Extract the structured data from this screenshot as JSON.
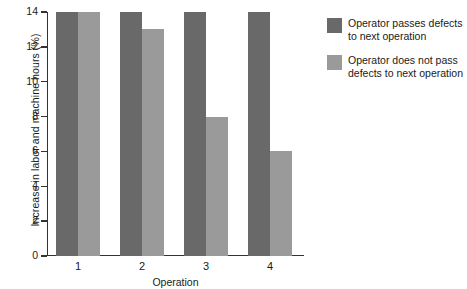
{
  "chart_data": {
    "type": "bar",
    "title": "",
    "xlabel": "Operation",
    "ylabel": "Increase in labor and machine hours (%)",
    "categories": [
      "1",
      "2",
      "3",
      "4"
    ],
    "ylim": [
      0,
      14
    ],
    "yticks": [
      "0",
      "2",
      "4",
      "6",
      "8",
      "10",
      "12",
      "14"
    ],
    "grid": false,
    "legend_position": "right",
    "series": [
      {
        "name": "Operator passes defects to next operation",
        "color": "#696969",
        "values": [
          14,
          14,
          14,
          14
        ]
      },
      {
        "name": "Operator does not pass defects to next operation",
        "color": "#9a9a9a",
        "values": [
          14,
          13,
          8,
          6
        ]
      }
    ]
  },
  "legend": {
    "items": [
      {
        "line1": "Operator passes defects",
        "line2": "to next operation",
        "color": "#696969"
      },
      {
        "line1": "Operator does not pass",
        "line2": "defects to next operation",
        "color": "#9a9a9a"
      }
    ]
  }
}
